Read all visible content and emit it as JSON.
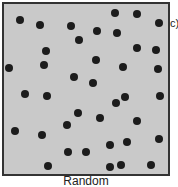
{
  "figure": {
    "panel_tag": "c)",
    "caption": "Random",
    "background": "#c9c9c9",
    "dot_color": "#1c1c1c",
    "dots": [
      [
        20,
        20
      ],
      [
        40,
        25
      ],
      [
        71,
        26
      ],
      [
        115,
        13
      ],
      [
        137,
        14
      ],
      [
        159,
        23
      ],
      [
        97,
        31
      ],
      [
        117,
        33
      ],
      [
        79,
        40
      ],
      [
        46,
        51
      ],
      [
        137,
        48
      ],
      [
        156,
        50
      ],
      [
        96,
        60
      ],
      [
        44,
        65
      ],
      [
        9,
        68
      ],
      [
        123,
        67
      ],
      [
        158,
        69
      ],
      [
        74,
        77
      ],
      [
        93,
        83
      ],
      [
        25,
        94
      ],
      [
        47,
        96
      ],
      [
        125,
        97
      ],
      [
        116,
        103
      ],
      [
        160,
        96
      ],
      [
        78,
        113
      ],
      [
        100,
        118
      ],
      [
        67,
        125
      ],
      [
        137,
        121
      ],
      [
        15,
        131
      ],
      [
        42,
        135
      ],
      [
        127,
        142
      ],
      [
        110,
        145
      ],
      [
        159,
        139
      ],
      [
        68,
        152
      ],
      [
        86,
        152
      ],
      [
        48,
        166
      ],
      [
        110,
        167
      ],
      [
        121,
        165
      ],
      [
        151,
        165
      ]
    ]
  }
}
